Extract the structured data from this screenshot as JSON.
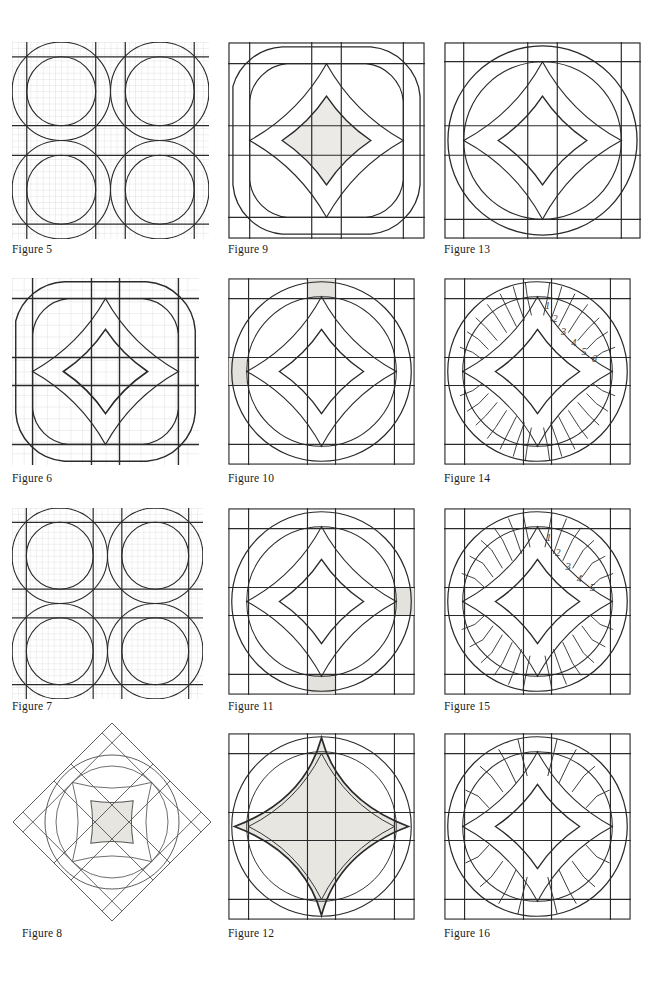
{
  "page": {
    "kind": "quilt-pattern-figure-sheet",
    "width": 671,
    "height": 982,
    "background": "#ffffff",
    "ink": "#1a1a1a",
    "grid_color": "#b9b9b9",
    "shade_color": "#e8e8e4",
    "columns": 3,
    "rows": 4
  },
  "figures": [
    {
      "id": "figure-5",
      "caption": "Figure 5",
      "col": 0,
      "row": 0,
      "x": 12,
      "y": 42,
      "size": 196,
      "style": "grid-tiled",
      "tiles": 2,
      "grid": true,
      "grid_divisions": 32,
      "shaded_cells": [],
      "numbers": [],
      "border": false
    },
    {
      "id": "figure-9",
      "caption": "Figure 9",
      "col": 1,
      "row": 0,
      "x": 228,
      "y": 42,
      "size": 196,
      "style": "single-block",
      "tiles": 1,
      "grid": false,
      "rings": 2,
      "shade_center": true,
      "shaded_cells": [],
      "numbers": [],
      "border": true
    },
    {
      "id": "figure-13",
      "caption": "Figure 13",
      "col": 2,
      "row": 0,
      "x": 444,
      "y": 42,
      "size": 196,
      "style": "circle-block",
      "tiles": 1,
      "grid": false,
      "rings": 2,
      "shade_center": false,
      "shaded_cells": [],
      "numbers": [],
      "border": true
    },
    {
      "id": "figure-6",
      "caption": "Figure 6",
      "col": 0,
      "row": 1,
      "x": 12,
      "y": 278,
      "size": 186,
      "style": "grid-single",
      "tiles": 1,
      "grid": true,
      "grid_divisions": 16,
      "shaded_cells": [],
      "numbers": [],
      "border": false
    },
    {
      "id": "figure-10",
      "caption": "Figure 10",
      "col": 1,
      "row": 1,
      "x": 228,
      "y": 278,
      "size": 186,
      "style": "single-block",
      "tiles": 1,
      "grid": false,
      "rings": 2,
      "shade_center": false,
      "shaded_cells": [
        "top-left-of-top-edge",
        "upper-left-edge"
      ],
      "numbers": [],
      "border": true
    },
    {
      "id": "figure-14",
      "caption": "Figure 14",
      "col": 2,
      "row": 1,
      "x": 444,
      "y": 278,
      "size": 186,
      "style": "pieced-block",
      "tiles": 1,
      "grid": false,
      "rings": 2,
      "segments_per_arc": 6,
      "shade_center": false,
      "shaded_cells": [],
      "numbers": [
        "1",
        "2",
        "3",
        "4",
        "5",
        "6"
      ],
      "border": true
    },
    {
      "id": "figure-7",
      "caption": "Figure 7",
      "col": 0,
      "row": 2,
      "x": 12,
      "y": 508,
      "size": 190,
      "style": "grid-tiled",
      "tiles": 2,
      "grid": true,
      "grid_divisions": 32,
      "shaded_cells": [],
      "numbers": [],
      "border": false
    },
    {
      "id": "figure-11",
      "caption": "Figure 11",
      "col": 1,
      "row": 2,
      "x": 228,
      "y": 508,
      "size": 186,
      "style": "single-block",
      "tiles": 1,
      "grid": false,
      "rings": 2,
      "shade_center": false,
      "shaded_cells": [
        "right-edge-lower",
        "bottom-edge-left"
      ],
      "numbers": [],
      "border": true
    },
    {
      "id": "figure-15",
      "caption": "Figure 15",
      "col": 2,
      "row": 2,
      "x": 444,
      "y": 508,
      "size": 186,
      "style": "pieced-block",
      "tiles": 1,
      "grid": false,
      "rings": 2,
      "segments_per_arc": 5,
      "shade_center": false,
      "shaded_cells": [],
      "numbers": [
        "1",
        "2",
        "3",
        "4",
        "5"
      ],
      "border": true
    },
    {
      "id": "figure-8",
      "caption": "Figure 8",
      "col": 0,
      "row": 3,
      "x": 14,
      "y": 728,
      "size": 196,
      "style": "rotated-block",
      "rotation": 45,
      "tiles": 1,
      "grid": false,
      "rings": 2,
      "shade_center": true,
      "shaded_cells": [],
      "numbers": [],
      "border": true
    },
    {
      "id": "figure-12",
      "caption": "Figure 12",
      "col": 1,
      "row": 3,
      "x": 228,
      "y": 733,
      "size": 186,
      "style": "single-block",
      "tiles": 1,
      "grid": false,
      "rings": 2,
      "shade_center": true,
      "shaded_cells": [],
      "numbers": [],
      "border": true
    },
    {
      "id": "figure-16",
      "caption": "Figure 16",
      "col": 2,
      "row": 3,
      "x": 444,
      "y": 733,
      "size": 186,
      "style": "pieced-block",
      "tiles": 1,
      "grid": false,
      "rings": 2,
      "segments_per_arc": 4,
      "shade_center": false,
      "shaded_cells": [],
      "numbers": [],
      "border": true
    }
  ],
  "captions": {
    "fig5": "Figure 5",
    "fig6": "Figure 6",
    "fig7": "Figure 7",
    "fig8": "Figure 8",
    "fig9": "Figure 9",
    "fig10": "Figure 10",
    "fig11": "Figure 11",
    "fig12": "Figure 12",
    "fig13": "Figure 13",
    "fig14": "Figure 14",
    "fig15": "Figure 15",
    "fig16": "Figure 16"
  },
  "caption_positions": {
    "fig5": {
      "x": 12,
      "y": 249
    },
    "fig9": {
      "x": 228,
      "y": 249
    },
    "fig13": {
      "x": 444,
      "y": 249
    },
    "fig6": {
      "x": 12,
      "y": 478
    },
    "fig10": {
      "x": 228,
      "y": 478
    },
    "fig14": {
      "x": 444,
      "y": 478
    },
    "fig7": {
      "x": 12,
      "y": 706
    },
    "fig11": {
      "x": 228,
      "y": 706
    },
    "fig15": {
      "x": 444,
      "y": 706
    },
    "fig8": {
      "x": 22,
      "y": 933
    },
    "fig12": {
      "x": 228,
      "y": 933
    },
    "fig16": {
      "x": 444,
      "y": 933
    }
  },
  "fig14_numbers": [
    "1",
    "2",
    "3",
    "4",
    "5",
    "6"
  ],
  "fig15_numbers": [
    "1",
    "2",
    "3",
    "4",
    "5"
  ]
}
